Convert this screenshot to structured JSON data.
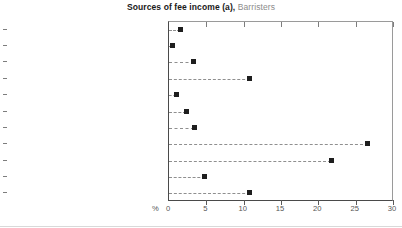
{
  "chart": {
    "title_main": "Sources of fee income (a),",
    "title_sub": "Barristers",
    "unit_label": "%"
  },
  "chart_data": {
    "type": "scatter",
    "title": "Sources of fee income (a), Barristers",
    "xlabel": "%",
    "ylabel": "",
    "xlim": [
      0,
      30
    ],
    "xticks": [
      0,
      5,
      10,
      15,
      20,
      25,
      30
    ],
    "xtick_labels": [
      "0",
      "5",
      "10",
      "15",
      "20",
      "25",
      "30"
    ],
    "grid": false,
    "legend": "none",
    "orientation": "horizontal",
    "leader_lines": true,
    "marker": "square",
    "marker_color": "#1e1e1e",
    "categories": [
      "Property",
      "Wills, probate and estate activities",
      "Family",
      "Criminal",
      "Environment",
      "Intellectual property",
      "Industrial relations",
      "Commercial",
      "Personal Injury",
      "Administrative / constitutional law",
      "Other"
    ],
    "values": [
      1.5,
      0.5,
      3.3,
      10.8,
      1.0,
      2.3,
      3.4,
      26.6,
      21.7,
      4.8,
      10.8
    ]
  }
}
